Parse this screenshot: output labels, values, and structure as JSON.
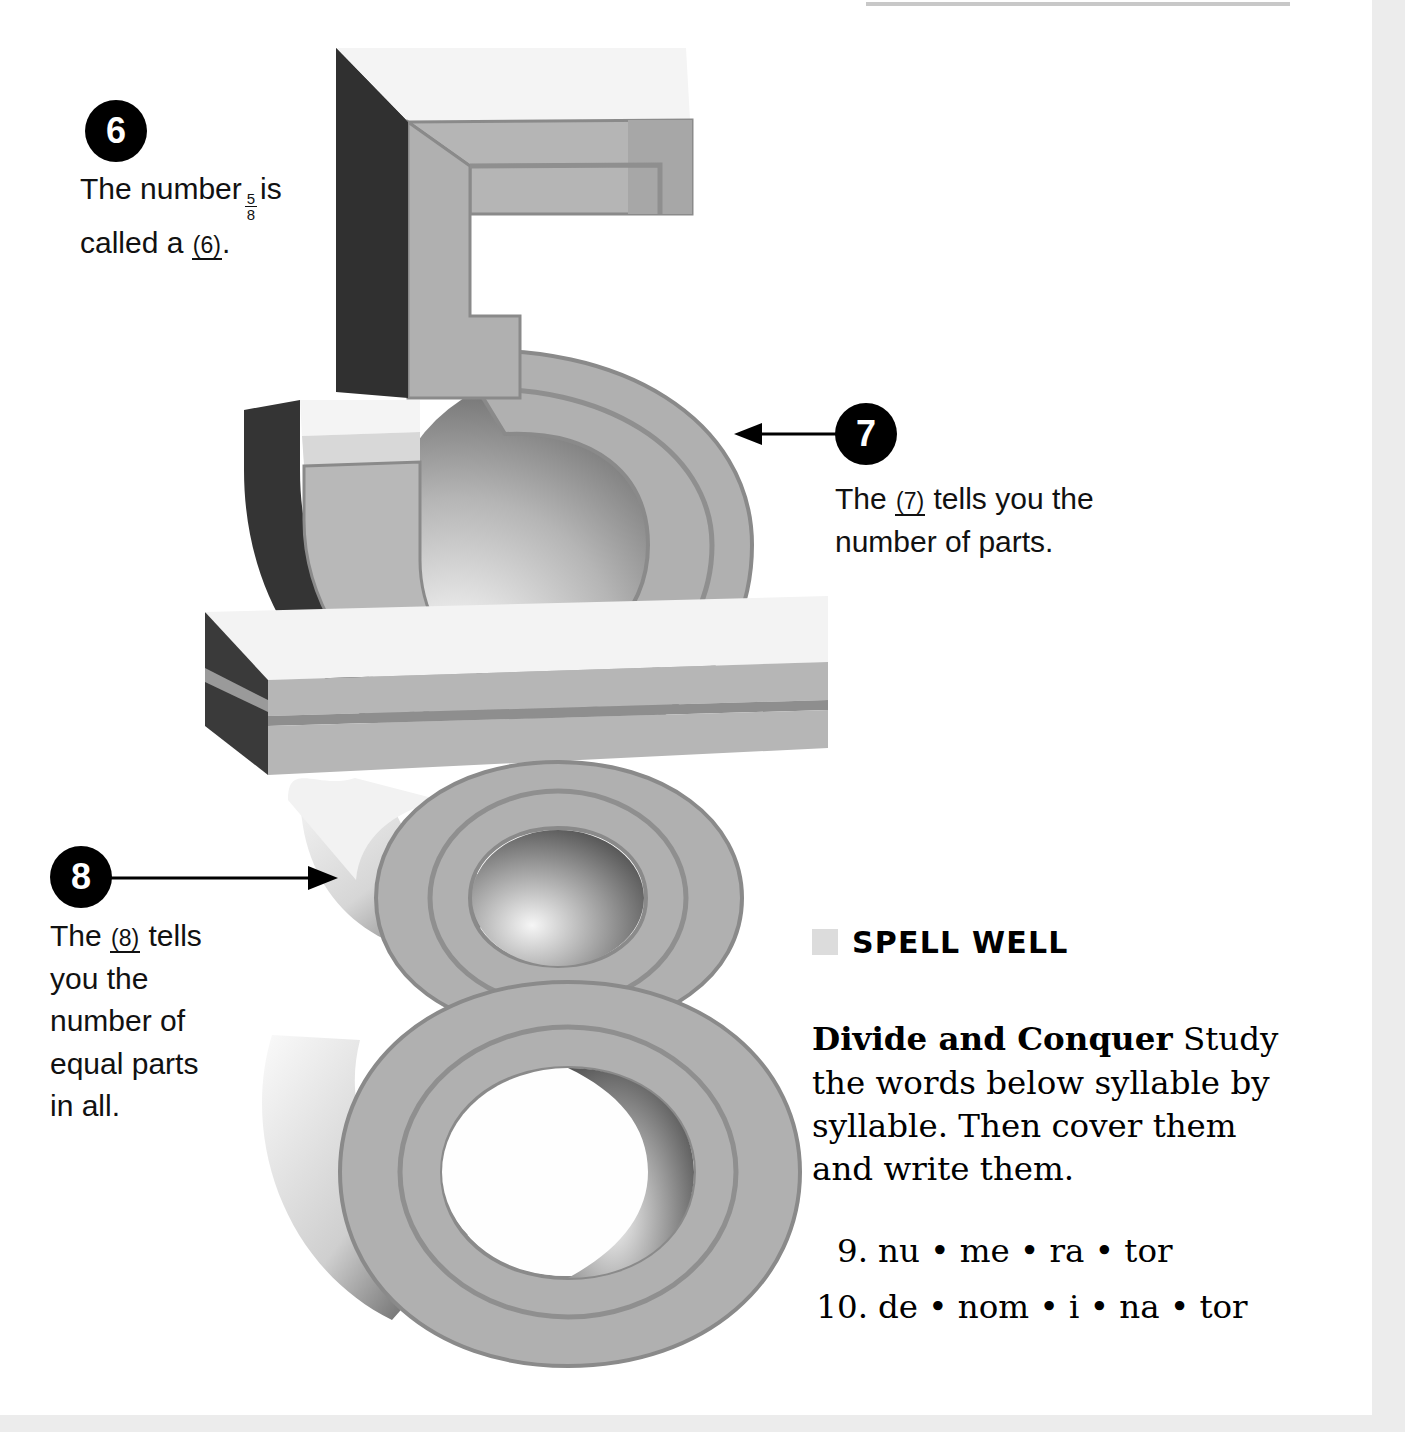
{
  "page": {
    "background_color": "#ffffff",
    "edge_band_color": "#ececec"
  },
  "callouts": [
    {
      "number": "6",
      "text_before_fraction": "The number",
      "fraction_numerator": "5",
      "fraction_denominator": "8",
      "text_after_fraction": "is called a",
      "blank_label": "(6)",
      "text_end": "."
    },
    {
      "number": "7",
      "text_start": "The",
      "blank_label": "(7)",
      "text_end": "tells you the number of parts.",
      "arrow_direction": "left"
    },
    {
      "number": "8",
      "text_start": "The",
      "blank_label": "(8)",
      "text_end": "tells you the number of equal parts in all.",
      "arrow_direction": "right"
    }
  ],
  "illustration": {
    "description": "three-dimensional fraction five over eight",
    "numerator_digit": "5",
    "denominator_digit": "8",
    "fraction_bar": "horizontal slab",
    "colors": {
      "top_face": "#f2f2f2",
      "front_face": "#a9a9a9",
      "front_face_light": "#bdbdbd",
      "outline": "#8a8a8a",
      "dark_side": "#333333",
      "shadow": "#6e6e6e"
    }
  },
  "spell_well": {
    "bullet_color": "#dcdcdc",
    "heading": "SPELL WELL",
    "body_lead": "Divide and Conquer",
    "body_text": "Study the words below syllable by syllable. Then cover them and write them.",
    "words": [
      {
        "number": "9.",
        "text": "nu • me • ra • tor"
      },
      {
        "number": "10.",
        "text": "de • nom • i • na • tor"
      }
    ]
  }
}
